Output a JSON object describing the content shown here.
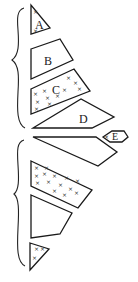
{
  "diagram": {
    "upper_group": {
      "brace": "left curly brace spanning shapes A-D",
      "shapes": [
        {
          "label": "A",
          "shape": "triangle",
          "fill": "crosses (sparse)"
        },
        {
          "label": "B",
          "shape": "trapezoid",
          "fill": "blank"
        },
        {
          "label": "C",
          "shape": "trapezoid",
          "fill": "crosses"
        },
        {
          "label": "D",
          "shape": "elongated trapezoid",
          "fill": "blank"
        }
      ]
    },
    "side_element": {
      "label": "E",
      "shape": "small hexagon/diamond",
      "fill": "crosses (sparse)"
    },
    "lower_group": {
      "brace": "left curly brace spanning four unlabeled shapes",
      "shapes": [
        {
          "label": "",
          "shape": "elongated trapezoid",
          "fill": "blank"
        },
        {
          "label": "",
          "shape": "trapezoid",
          "fill": "crosses"
        },
        {
          "label": "",
          "shape": "trapezoid",
          "fill": "blank"
        },
        {
          "label": "",
          "shape": "triangle",
          "fill": "crosses (sparse)"
        }
      ]
    },
    "labels": {
      "a": "A",
      "b": "B",
      "c": "C",
      "d": "D",
      "e": "E"
    },
    "colors": {
      "line": "#1a1a1a",
      "background": "#ffffff"
    }
  }
}
